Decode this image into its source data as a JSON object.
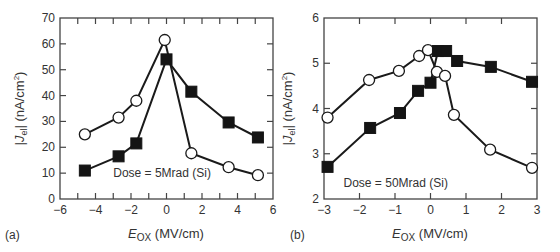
{
  "figure": {
    "panel_a_label": "(a)",
    "panel_b_label": "(b)"
  },
  "chart_data": [
    {
      "type": "line",
      "panel": "(a)",
      "title": "",
      "xlabel": "E_OX (MV/cm)",
      "xlabel_main": "E",
      "xlabel_sub": "OX",
      "xlabel_unit": " (MV/cm)",
      "ylabel": "|J_el| (nA/cm^2)",
      "ylabel_main": "|J",
      "ylabel_sub": "el",
      "ylabel_unit": "| (nA/cm",
      "ylabel_sup": "2",
      "ylabel_close": ")",
      "xlim": [
        -6,
        6
      ],
      "ylim": [
        0,
        70
      ],
      "xticks": [
        -6,
        -4,
        -2,
        0,
        2,
        4,
        6
      ],
      "yticks": [
        0,
        10,
        20,
        30,
        40,
        50,
        60,
        70
      ],
      "xticks_labels": [
        "−6",
        "−4",
        "−2",
        "0",
        "2",
        "4",
        "6"
      ],
      "yticks_labels": [
        "0",
        "10",
        "20",
        "30",
        "40",
        "50",
        "60",
        "70"
      ],
      "grid": false,
      "annotation": "Dose = 5Mrad (Si)",
      "annotation_pos": [
        -3.0,
        10
      ],
      "series": [
        {
          "name": "open circles",
          "marker": "circle",
          "x": [
            -4.6,
            -2.7,
            -1.7,
            -0.1,
            1.4,
            3.5,
            5.15
          ],
          "y": [
            25,
            31.5,
            38,
            61.5,
            17.7,
            12.3,
            9.2
          ]
        },
        {
          "name": "filled squares",
          "marker": "square",
          "x": [
            -4.6,
            -2.7,
            -1.7,
            0.0,
            1.4,
            3.5,
            5.15
          ],
          "y": [
            11,
            16.5,
            21.5,
            54,
            41.5,
            29.6,
            23.8
          ]
        }
      ]
    },
    {
      "type": "line",
      "panel": "(b)",
      "title": "",
      "xlabel": "E_OX (MV/cm)",
      "xlabel_main": "E",
      "xlabel_sub": "OX",
      "xlabel_unit": " (MV/cm)",
      "ylabel": "|J_el| (nA/cm^2)",
      "ylabel_main": "|J",
      "ylabel_sub": "el",
      "ylabel_unit": "| (nA/cm",
      "ylabel_sup": "2",
      "ylabel_close": ")",
      "xlim": [
        -3,
        3
      ],
      "ylim": [
        2,
        6
      ],
      "xticks": [
        -3,
        -2,
        -1,
        0,
        1,
        2,
        3
      ],
      "yticks": [
        2,
        3,
        4,
        5,
        6
      ],
      "xticks_labels": [
        "−3",
        "−2",
        "−1",
        "0",
        "1",
        "2",
        "3"
      ],
      "yticks_labels": [
        "2",
        "3",
        "4",
        "5",
        "6"
      ],
      "grid": false,
      "annotation": "Dose = 50Mrad (Si)",
      "annotation_pos": [
        -2.45,
        2.35
      ],
      "series": [
        {
          "name": "open circles",
          "marker": "circle",
          "x": [
            -2.9,
            -1.73,
            -0.89,
            -0.32,
            -0.07,
            0.18,
            0.41,
            0.66,
            1.68,
            2.86
          ],
          "y": [
            3.8,
            4.63,
            4.83,
            5.16,
            5.29,
            4.81,
            4.72,
            3.86,
            3.09,
            2.69
          ]
        },
        {
          "name": "filled squares",
          "marker": "square",
          "x": [
            -2.9,
            -1.7,
            -0.86,
            -0.35,
            0.0,
            0.21,
            0.44,
            0.75,
            1.7,
            2.86
          ],
          "y": [
            2.71,
            3.57,
            3.9,
            4.39,
            4.57,
            5.27,
            5.27,
            5.05,
            4.92,
            4.59
          ]
        }
      ]
    }
  ]
}
